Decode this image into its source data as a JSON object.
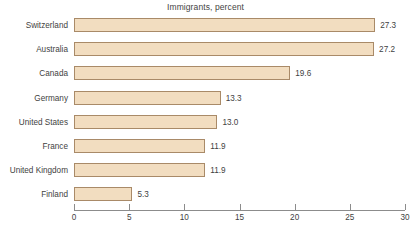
{
  "chart_data": {
    "type": "bar",
    "orientation": "horizontal",
    "title": "Immigrants, percent",
    "xlabel": "",
    "ylabel": "",
    "categories": [
      "Switzerland",
      "Australia",
      "Canada",
      "Germany",
      "United States",
      "France",
      "United Kingdom",
      "Finland"
    ],
    "values": [
      27.3,
      27.2,
      19.6,
      13.3,
      13.0,
      11.9,
      11.9,
      5.3
    ],
    "value_labels": [
      "27.3",
      "27.2",
      "19.6",
      "13.3",
      "13.0",
      "11.9",
      "11.9",
      "5.3"
    ],
    "xlim": [
      0,
      30
    ],
    "xticks": [
      0,
      5,
      10,
      15,
      20,
      25,
      30
    ],
    "xtick_labels": [
      "0",
      "5",
      "10",
      "15",
      "20",
      "25",
      "30"
    ],
    "grid": false,
    "legend": false,
    "bar_fill_color": "#f2ddc0",
    "bar_border_color": "#a98a68",
    "axis_color": "#8c8c8c",
    "text_color": "#3f3f3f",
    "background_color": "#ffffff"
  }
}
